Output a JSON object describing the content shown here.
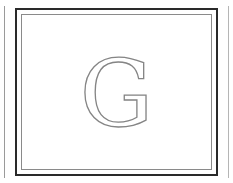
{
  "monogram": {
    "letter": "G",
    "color": "#858585"
  },
  "frame": {
    "outer_border_color": "#2a2a2a",
    "inner_border_color": "#8a8a8a"
  }
}
